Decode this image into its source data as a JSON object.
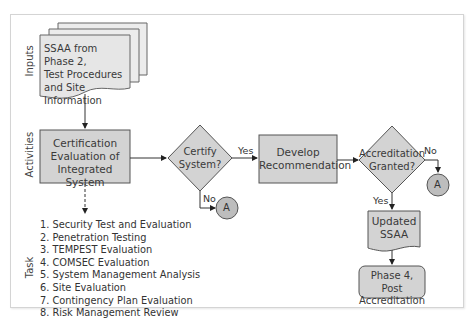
{
  "lanes": {
    "inputs": "Inputs",
    "activities": "Activities",
    "task": "Task"
  },
  "nodes": {
    "input_doc": {
      "line1": "SSAA from Phase 2,",
      "line2": "Test Procedures",
      "line3": "and Site Information"
    },
    "certification": {
      "line1": "Certification",
      "line2": "Evaluation of",
      "line3": "Integrated System"
    },
    "certify_decision": {
      "line1": "Certify",
      "line2": "System?"
    },
    "develop": {
      "line1": "Develop",
      "line2": "Recommendation"
    },
    "accreditation_decision": {
      "line1": "Accreditation",
      "line2": "Granted?"
    },
    "updated_ssaa": {
      "line1": "Updated",
      "line2": "SSAA"
    },
    "phase4": {
      "line1": "Phase 4, Post",
      "line2": "Accreditation"
    },
    "connector_a1": "A",
    "connector_a2": "A"
  },
  "edges": {
    "certify_yes": "Yes",
    "certify_no": "No",
    "accred_yes": "Yes",
    "accred_no": "No"
  },
  "tasks": [
    "1. Security Test and Evaluation",
    "2. Penetration Testing",
    "3. TEMPEST Evaluation",
    "4. COMSEC Evaluation",
    "5. System Management Analysis",
    "6. Site Evaluation",
    "7. Contingency Plan Evaluation",
    "8. Risk Management Review"
  ],
  "colors": {
    "fill": "#d3d3d3",
    "fill_light": "#e8e8e8",
    "stroke": "#555555",
    "frame": "#d4d4d4"
  }
}
